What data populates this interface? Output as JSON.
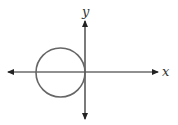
{
  "diagram": {
    "type": "coordinate-plane",
    "axes": {
      "x_label": "x",
      "y_label": "y",
      "color": "#222222"
    },
    "circle": {
      "description": "circle tangent to y-axis at origin, centered on negative x-axis",
      "stroke": "#666666"
    }
  }
}
